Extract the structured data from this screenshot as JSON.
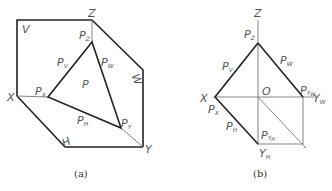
{
  "figure_a": {
    "caption": "(a)",
    "labels": {
      "V": "V",
      "Z": "Z",
      "X": "X",
      "Y": "Y",
      "W": "W",
      "H": "H",
      "P": "P",
      "Pz_main": "P",
      "Pz_sub": "Z",
      "Pv_main": "P",
      "Pv_sub": "V",
      "Pw_main": "P",
      "Pw_sub": "W",
      "Px_main": "P",
      "Px_sub": "X",
      "Ph_main": "P",
      "Ph_sub": "H",
      "Py_main": "P",
      "Py_sub": "Y"
    }
  },
  "figure_b": {
    "caption": "(b)",
    "labels": {
      "Z": "Z",
      "X": "X",
      "O": "O",
      "Yw_main": "Y",
      "Yw_sub": "W",
      "Yh_main": "Y",
      "Yh_sub": "H",
      "Pz_main": "P",
      "Pz_sub": "Z",
      "Pv_main": "P",
      "Pv_sub": "V",
      "Pw_main": "P",
      "Pw_sub": "W",
      "Px_main": "P",
      "Px_sub": "X",
      "Ph_main": "P",
      "Ph_sub": "H",
      "Pyw_main": "P",
      "Pyw_sub": "Y",
      "Pyw_subsub": "W",
      "Pyh_main": "P",
      "Pyh_sub": "Y",
      "Pyh_subsub": "H"
    }
  }
}
